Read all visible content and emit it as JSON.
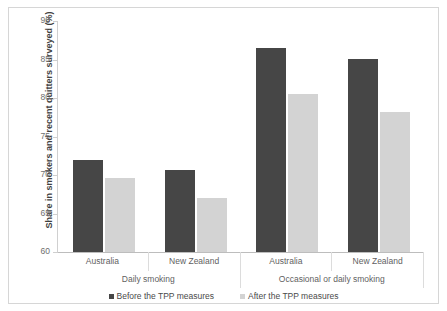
{
  "chart_data": {
    "type": "bar",
    "title": "",
    "subtitle": "",
    "xlabel": "",
    "ylabel": "Share in smokers and recent quitters surveyed (%)",
    "ylim": [
      60,
      90
    ],
    "yticks": [
      60,
      65,
      70,
      75,
      80,
      85,
      90
    ],
    "ytick_labels": [
      "60",
      "65",
      "70",
      "75",
      "80",
      "85",
      "90"
    ],
    "grid": false,
    "legend_position": "bottom",
    "groups": [
      {
        "label": "Daily smoking",
        "categories": [
          "Australia",
          "New Zealand"
        ]
      },
      {
        "label": "Occasional or daily smoking",
        "categories": [
          "Australia",
          "New Zealand"
        ]
      }
    ],
    "categories": [
      "Australia",
      "New Zealand",
      "Australia",
      "New Zealand"
    ],
    "series": [
      {
        "name": "Before the TPP measures",
        "color": "#464646",
        "values": [
          72.0,
          70.6,
          86.5,
          85.1
        ]
      },
      {
        "name": "After the TPP measures",
        "color": "#d3d3d3",
        "values": [
          69.6,
          67.0,
          80.5,
          78.2
        ]
      }
    ]
  },
  "legend": {
    "items": [
      {
        "label": "Before the TPP measures"
      },
      {
        "label": "After the TPP measures"
      }
    ]
  },
  "colors": {
    "before": "#464646",
    "after": "#d3d3d3",
    "axis": "#cfcfcf",
    "text": "#5f5f5f",
    "border": "#d6d6d6"
  }
}
